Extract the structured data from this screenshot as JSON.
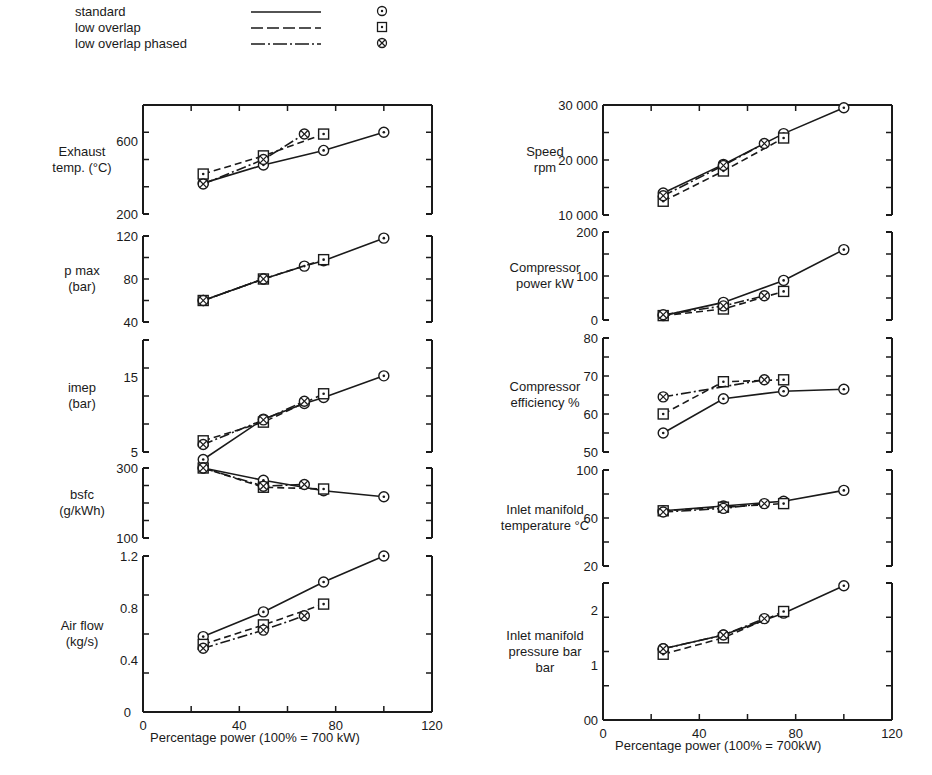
{
  "legend": [
    {
      "label": "standard",
      "line": "solid",
      "marker": "circle-dot"
    },
    {
      "label": "low overlap",
      "line": "dashed",
      "marker": "square-dot"
    },
    {
      "label": "low overlap phased",
      "line": "dash-dot",
      "marker": "circle-cross"
    }
  ],
  "x_axis": {
    "left": {
      "label": "Percentage power (100% = 700 kW)",
      "ticks": [
        0,
        40,
        80,
        120
      ]
    },
    "right": {
      "label": "Percentage power (100% = 700kW)",
      "ticks": [
        0,
        40,
        80,
        120
      ]
    }
  },
  "chart_data": [
    {
      "type": "line",
      "column": "left",
      "title": "Exhaust temp. (°C)",
      "ylabel": [
        "Exhaust",
        "temp. (°C)"
      ],
      "ylim": [
        200,
        800
      ],
      "yticks": [
        200,
        600
      ],
      "xlim": [
        0,
        120
      ],
      "series": [
        {
          "name": "standard",
          "x": [
            25,
            50,
            75,
            100
          ],
          "y": [
            370,
            470,
            550,
            650
          ]
        },
        {
          "name": "low overlap",
          "x": [
            25,
            50,
            75
          ],
          "y": [
            420,
            520,
            640
          ]
        },
        {
          "name": "low overlap phased",
          "x": [
            25,
            50,
            67
          ],
          "y": [
            365,
            500,
            640
          ]
        }
      ]
    },
    {
      "type": "line",
      "column": "left",
      "title": "p max (bar)",
      "ylabel": [
        "p max",
        "(bar)"
      ],
      "ylim": [
        40,
        120
      ],
      "yticks": [
        40,
        80,
        120
      ],
      "xlim": [
        0,
        120
      ],
      "series": [
        {
          "name": "standard",
          "x": [
            25,
            50,
            67,
            75,
            100
          ],
          "y": [
            60,
            80,
            92,
            97,
            118
          ]
        },
        {
          "name": "low overlap",
          "x": [
            25,
            50,
            75
          ],
          "y": [
            60,
            80,
            98
          ]
        },
        {
          "name": "low overlap phased",
          "x": [
            25,
            50
          ],
          "y": [
            60,
            80
          ]
        }
      ]
    },
    {
      "type": "line",
      "column": "left",
      "title": "imep (bar)",
      "ylabel": [
        "imep",
        "(bar)"
      ],
      "ylim": [
        5,
        20
      ],
      "yticks": [
        5,
        15
      ],
      "xlim": [
        0,
        120
      ],
      "series": [
        {
          "name": "standard",
          "x": [
            25,
            50,
            67,
            75,
            100
          ],
          "y": [
            4,
            9.4,
            11.5,
            12.3,
            15.2
          ]
        },
        {
          "name": "low overlap",
          "x": [
            25,
            50,
            75
          ],
          "y": [
            6.5,
            9,
            12.8
          ]
        },
        {
          "name": "low overlap phased",
          "x": [
            25,
            50,
            67
          ],
          "y": [
            6,
            9.3,
            11.8
          ]
        }
      ]
    },
    {
      "type": "line",
      "column": "left",
      "title": "bsfc (g/kWh)",
      "ylabel": [
        "bsfc",
        "(g/kWh)"
      ],
      "ylim": [
        100,
        300
      ],
      "yticks": [
        100,
        300
      ],
      "xlim": [
        0,
        120
      ],
      "series": [
        {
          "name": "standard",
          "x": [
            25,
            50,
            75,
            100
          ],
          "y": [
            320,
            265,
            235,
            218
          ]
        },
        {
          "name": "low overlap",
          "x": [
            25,
            50,
            75
          ],
          "y": [
            310,
            245,
            240
          ]
        },
        {
          "name": "low overlap phased",
          "x": [
            25,
            50,
            67
          ],
          "y": [
            330,
            248,
            253
          ]
        }
      ]
    },
    {
      "type": "line",
      "column": "left",
      "title": "Air flow (kg/s)",
      "ylabel": [
        "Air flow",
        "(kg/s)"
      ],
      "ylim": [
        0,
        1.2
      ],
      "yticks": [
        0.4,
        0.8,
        1.2
      ],
      "xlim": [
        0,
        120
      ],
      "series": [
        {
          "name": "standard",
          "x": [
            25,
            50,
            75,
            100
          ],
          "y": [
            0.58,
            0.77,
            1.0,
            1.21
          ]
        },
        {
          "name": "low overlap",
          "x": [
            25,
            50,
            75
          ],
          "y": [
            0.52,
            0.67,
            0.83
          ]
        },
        {
          "name": "low overlap phased",
          "x": [
            25,
            50,
            67
          ],
          "y": [
            0.49,
            0.63,
            0.74
          ]
        }
      ]
    },
    {
      "type": "line",
      "column": "right",
      "title": "Speed rpm",
      "ylabel": [
        "Speed",
        "rpm"
      ],
      "ylim": [
        10000,
        30000
      ],
      "yticks": [
        10000,
        20000,
        30000
      ],
      "ytick_labels": [
        "10 000",
        "20 000",
        "30 000"
      ],
      "xlim": [
        0,
        120
      ],
      "series": [
        {
          "name": "standard",
          "x": [
            25,
            50,
            75,
            100
          ],
          "y": [
            14000,
            19200,
            24800,
            29500
          ]
        },
        {
          "name": "low overlap",
          "x": [
            25,
            50,
            75
          ],
          "y": [
            12500,
            18000,
            24000
          ]
        },
        {
          "name": "low overlap phased",
          "x": [
            25,
            50,
            67
          ],
          "y": [
            13500,
            19000,
            23000
          ]
        }
      ]
    },
    {
      "type": "line",
      "column": "right",
      "title": "Compressor power kW",
      "ylabel": [
        "Compressor",
        "power kW"
      ],
      "ylim": [
        0,
        200
      ],
      "yticks": [
        0,
        100,
        200
      ],
      "xlim": [
        0,
        120
      ],
      "series": [
        {
          "name": "standard",
          "x": [
            25,
            50,
            75,
            100
          ],
          "y": [
            10,
            40,
            90,
            160
          ]
        },
        {
          "name": "low overlap",
          "x": [
            25,
            50,
            75
          ],
          "y": [
            10,
            25,
            65
          ]
        },
        {
          "name": "low overlap phased",
          "x": [
            25,
            50,
            67
          ],
          "y": [
            12,
            32,
            55
          ]
        }
      ]
    },
    {
      "type": "line",
      "column": "right",
      "title": "Compressor efficiency %",
      "ylabel": [
        "Compressor",
        "efficiency %"
      ],
      "ylim": [
        50,
        80
      ],
      "yticks": [
        50,
        60,
        70,
        80
      ],
      "xlim": [
        0,
        120
      ],
      "series": [
        {
          "name": "standard",
          "x": [
            25,
            50,
            75,
            100
          ],
          "y": [
            55,
            64,
            66,
            66.5
          ]
        },
        {
          "name": "low overlap",
          "x": [
            25,
            50,
            75
          ],
          "y": [
            60,
            68.5,
            69
          ]
        },
        {
          "name": "low overlap phased",
          "x": [
            25,
            67
          ],
          "y": [
            64.5,
            69
          ]
        }
      ]
    },
    {
      "type": "line",
      "column": "right",
      "title": "Inlet manifold temperature °C",
      "ylabel": [
        "Inlet manifold",
        "temperature °C"
      ],
      "ylim": [
        20,
        100
      ],
      "yticks": [
        20,
        60,
        100
      ],
      "xlim": [
        0,
        120
      ],
      "series": [
        {
          "name": "standard",
          "x": [
            25,
            50,
            75,
            100
          ],
          "y": [
            66,
            70,
            74,
            83
          ]
        },
        {
          "name": "low overlap",
          "x": [
            25,
            50,
            75
          ],
          "y": [
            66,
            69,
            72
          ]
        },
        {
          "name": "low overlap phased",
          "x": [
            25,
            50,
            67
          ],
          "y": [
            65,
            68,
            72
          ]
        }
      ]
    },
    {
      "type": "line",
      "column": "right",
      "title": "Inlet manifold pressure bar",
      "ylabel": [
        "Inlet manifold",
        "pressure bar",
        "bar"
      ],
      "ylim": [
        0,
        2.5
      ],
      "yticks": [
        0,
        1.0,
        2.0
      ],
      "xlim": [
        0,
        120
      ],
      "series": [
        {
          "name": "standard",
          "x": [
            25,
            50,
            75,
            100
          ],
          "y": [
            1.3,
            1.55,
            1.95,
            2.45
          ]
        },
        {
          "name": "low overlap",
          "x": [
            25,
            50,
            75
          ],
          "y": [
            1.2,
            1.5,
            1.98
          ]
        },
        {
          "name": "low overlap phased",
          "x": [
            25,
            50,
            67
          ],
          "y": [
            1.3,
            1.55,
            1.85
          ]
        }
      ]
    }
  ]
}
